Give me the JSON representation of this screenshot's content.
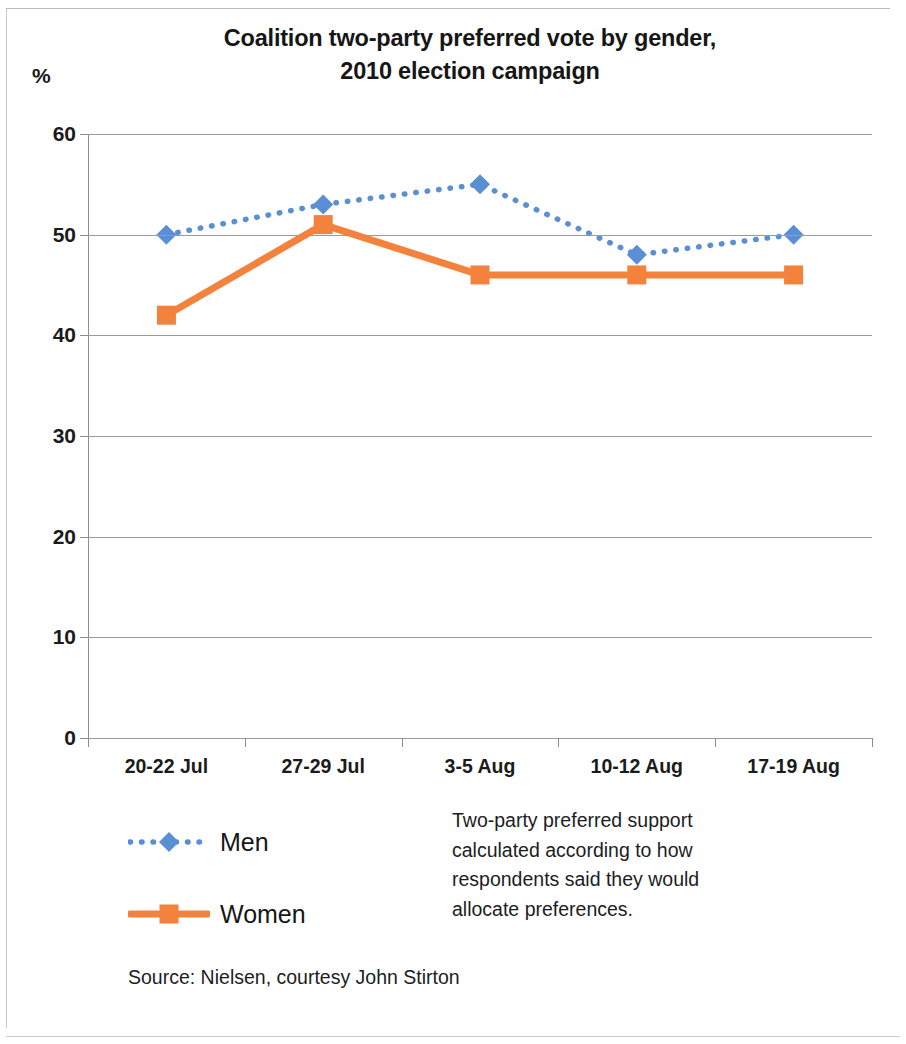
{
  "chart_data": {
    "type": "line",
    "title": "Coalition two-party preferred vote by gender, 2010 election campaign",
    "title_lines": [
      "Coalition two-party preferred vote by gender,",
      "2010 election campaign"
    ],
    "unit_label": "%",
    "xlabel": "",
    "ylabel": "%",
    "categories": [
      "20-22 Jul",
      "27-29 Jul",
      "3-5 Aug",
      "10-12 Aug",
      "17-19 Aug"
    ],
    "ylim": [
      0,
      60
    ],
    "ytick_step": 10,
    "yticks": [
      "60",
      "50",
      "40",
      "30",
      "20",
      "10",
      "0"
    ],
    "ytick_values": [
      60,
      50,
      40,
      30,
      20,
      10,
      0
    ],
    "grid": true,
    "legend_position": "below-left",
    "series": [
      {
        "name": "Men",
        "values": [
          50,
          53,
          55,
          48,
          50
        ],
        "color": "#5B8FD4",
        "line_style": "dotted",
        "marker": "diamond"
      },
      {
        "name": "Women",
        "values": [
          42,
          51,
          46,
          46,
          46
        ],
        "color": "#F2823C",
        "line_style": "solid",
        "marker": "square"
      }
    ],
    "annotation_lines": [
      "Two-party preferred support",
      "calculated according to how",
      "respondents said they would",
      "allocate preferences."
    ],
    "source": "Source: Nielsen, courtesy John Stirton"
  },
  "colors": {
    "men": "#5B8FD4",
    "women": "#F2823C",
    "gridline": "#9a9a9a",
    "axis": "#8d8d8d",
    "text": "#161616",
    "background": "#ffffff"
  }
}
